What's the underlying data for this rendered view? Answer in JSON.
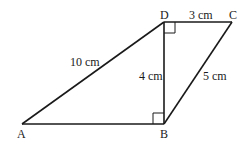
{
  "diagram": {
    "vertices": {
      "A": {
        "label": "A",
        "x": 22,
        "y": 124
      },
      "B": {
        "label": "B",
        "x": 164,
        "y": 124
      },
      "C": {
        "label": "C",
        "x": 232,
        "y": 22
      },
      "D": {
        "label": "D",
        "x": 164,
        "y": 22
      }
    },
    "edges": {
      "AD": {
        "label": "10 cm"
      },
      "DC": {
        "label": "3 cm"
      },
      "BD": {
        "label": "4 cm"
      },
      "BC": {
        "label": "5 cm"
      },
      "AB": {
        "label": ""
      }
    },
    "right_angles": [
      "D",
      "B"
    ],
    "colors": {
      "line": "#1a1a1a",
      "background": "#ffffff"
    }
  }
}
